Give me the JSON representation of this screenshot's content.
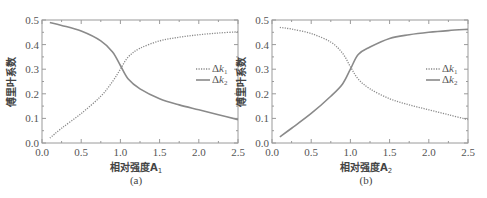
{
  "chart_data": [
    {
      "type": "line",
      "panel": "(a)",
      "title": "",
      "xlabel": "相对强度A1",
      "ylabel": "傅里叶系数",
      "xlim": [
        0.0,
        2.5
      ],
      "ylim": [
        0.0,
        0.5
      ],
      "xticks": [
        "0.0",
        "0.5",
        "1.0",
        "1.5",
        "2.0",
        "2.5"
      ],
      "yticks": [
        "0.0",
        "0.1",
        "0.2",
        "0.3",
        "0.4",
        "0.5"
      ],
      "grid": false,
      "legend_position": "right-middle",
      "x": [
        0.1,
        0.25,
        0.5,
        0.75,
        0.9,
        1.0,
        1.1,
        1.25,
        1.5,
        1.75,
        2.0,
        2.25,
        2.5
      ],
      "series": [
        {
          "name": "Δk1",
          "style": "dotted",
          "values": [
            0.02,
            0.06,
            0.12,
            0.19,
            0.25,
            0.3,
            0.35,
            0.385,
            0.415,
            0.43,
            0.44,
            0.447,
            0.452
          ]
        },
        {
          "name": "Δk2",
          "style": "solid",
          "values": [
            0.49,
            0.478,
            0.455,
            0.415,
            0.37,
            0.315,
            0.26,
            0.22,
            0.18,
            0.155,
            0.135,
            0.115,
            0.095
          ]
        }
      ]
    },
    {
      "type": "line",
      "panel": "(b)",
      "title": "",
      "xlabel": "相对强度A2",
      "ylabel": "傅里叶系数",
      "xlim": [
        0.0,
        2.5
      ],
      "ylim": [
        0.0,
        0.5
      ],
      "xticks": [
        "0.0",
        "0.5",
        "1.0",
        "1.5",
        "2.0",
        "2.5"
      ],
      "yticks": [
        "0.0",
        "0.1",
        "0.2",
        "0.3",
        "0.4",
        "0.5"
      ],
      "grid": false,
      "legend_position": "right-middle",
      "x": [
        0.1,
        0.25,
        0.5,
        0.75,
        0.9,
        1.0,
        1.1,
        1.25,
        1.5,
        1.75,
        2.0,
        2.25,
        2.5
      ],
      "series": [
        {
          "name": "Δk1",
          "style": "dotted",
          "values": [
            0.47,
            0.463,
            0.445,
            0.41,
            0.365,
            0.31,
            0.26,
            0.22,
            0.18,
            0.155,
            0.135,
            0.115,
            0.095
          ]
        },
        {
          "name": "Δk2",
          "style": "solid",
          "values": [
            0.025,
            0.06,
            0.12,
            0.19,
            0.24,
            0.3,
            0.36,
            0.39,
            0.425,
            0.44,
            0.45,
            0.457,
            0.462
          ]
        }
      ]
    }
  ],
  "panels": [
    {
      "caption": "(a)",
      "xlabel": "相对强度A",
      "xlabel_sub": "1",
      "ylabel": "傅里叶系数",
      "legend": [
        {
          "label": "Δk",
          "sub": "1"
        },
        {
          "label": "Δk",
          "sub": "2"
        }
      ]
    },
    {
      "caption": "(b)",
      "xlabel": "相对强度A",
      "xlabel_sub": "2",
      "ylabel": "傅里叶系数",
      "legend": [
        {
          "label": "Δk",
          "sub": "1"
        },
        {
          "label": "Δk",
          "sub": "2"
        }
      ]
    }
  ],
  "ticks": {
    "x": [
      "0.0",
      "0.5",
      "1.0",
      "1.5",
      "2.0",
      "2.5"
    ],
    "y": [
      "0.0",
      "0.1",
      "0.2",
      "0.3",
      "0.4",
      "0.5"
    ]
  },
  "colors": {
    "line": "#8a8a8a",
    "frame": "#9a9a9a",
    "text": "#555555"
  }
}
